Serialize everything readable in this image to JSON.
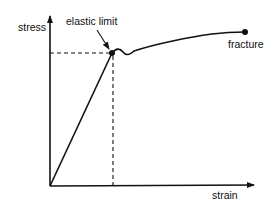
{
  "diagram": {
    "axes": {
      "y_label": "stress",
      "x_label": "strain"
    },
    "annotations": {
      "elastic_limit": "elastic limit",
      "fracture": "fracture"
    },
    "colors": {
      "line": "#111111",
      "background": "#ffffff"
    }
  }
}
